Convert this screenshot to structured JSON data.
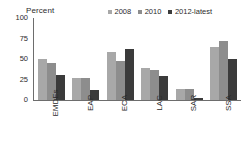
{
  "chart_data": {
    "type": "bar",
    "title": "",
    "subtitle": "",
    "ylabel": "Percent",
    "xlabel": "",
    "ylim": [
      0,
      100
    ],
    "yticks": [
      100,
      75,
      50,
      25,
      0
    ],
    "grid": false,
    "legend_position": "top-right",
    "categories": [
      "EMDEs",
      "EAP",
      "ECA",
      "LAC",
      "SAR",
      "SSA"
    ],
    "series": [
      {
        "name": "2008",
        "color": "#a8a8a8",
        "values": [
          50,
          27,
          58,
          39,
          14,
          65
        ]
      },
      {
        "name": "2010",
        "color": "#8d8d8d",
        "values": [
          45,
          27,
          47,
          37,
          13,
          72
        ]
      },
      {
        "name": "2012-latest",
        "color": "#3b3b3b",
        "values": [
          31,
          12,
          62,
          29,
          2,
          50
        ]
      }
    ]
  }
}
